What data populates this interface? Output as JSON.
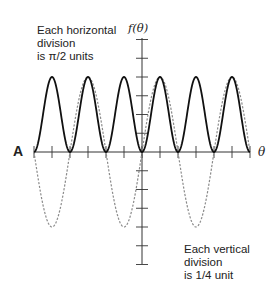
{
  "figure": {
    "panel_label": "A",
    "note_horizontal_line1": "Each horizontal",
    "note_horizontal_line2": "division",
    "note_horizontal_line3": "is π/2 units",
    "note_vertical_line1": "Each vertical division",
    "note_vertical_line2": "is 1/4 unit",
    "y_axis_label": "f(θ)",
    "x_axis_label": "θ"
  },
  "chart_data": {
    "type": "line",
    "title": "",
    "xlabel": "θ",
    "ylabel": "f(θ)",
    "x_range": [
      -9.4248,
      9.4248
    ],
    "y_range": [
      -1.5,
      1.5
    ],
    "x_tick_spacing": "π/2",
    "y_tick_spacing": 0.25,
    "x_ticks": [
      "-3π",
      "-5π/2",
      "-2π",
      "-3π/2",
      "-π",
      "-π/2",
      "0",
      "π/2",
      "π",
      "3π/2",
      "2π",
      "5π/2",
      "3π"
    ],
    "y_ticks": [
      -1.5,
      -1.25,
      -1.0,
      -0.75,
      -0.5,
      -0.25,
      0,
      0.25,
      0.5,
      0.75,
      1.0,
      1.25,
      1.5
    ],
    "grid": false,
    "legend": null,
    "annotations": [
      "Each horizontal division is π/2 units",
      "Each vertical division is 1/4 unit",
      "A"
    ],
    "series": [
      {
        "name": "solid curve",
        "style": "solid",
        "color": "#111111",
        "expression": "sin^2(θ)",
        "x": [
          "-3π",
          "-5π/2",
          "-2π",
          "-3π/2",
          "-π",
          "-π/2",
          "0",
          "π/2",
          "π",
          "3π/2",
          "2π",
          "5π/2",
          "3π"
        ],
        "values": [
          0,
          1,
          0,
          1,
          0,
          1,
          0,
          1,
          0,
          1,
          0,
          1,
          0
        ]
      },
      {
        "name": "dashed curve",
        "style": "dashed",
        "color": "#888888",
        "expression": "sin(θ)",
        "x": [
          "-3π",
          "-5π/2",
          "-2π",
          "-3π/2",
          "-π",
          "-π/2",
          "0",
          "π/2",
          "π",
          "3π/2",
          "2π",
          "5π/2",
          "3π"
        ],
        "values": [
          0,
          -1,
          0,
          1,
          0,
          -1,
          0,
          1,
          0,
          -1,
          0,
          1,
          0
        ]
      }
    ]
  },
  "layout": {
    "origin_x": 142,
    "origin_y": 152,
    "px_per_half_pi": 18,
    "px_per_unit": 75,
    "x_start": 34,
    "x_end": 250,
    "y_top": 38,
    "y_bottom": 264
  }
}
